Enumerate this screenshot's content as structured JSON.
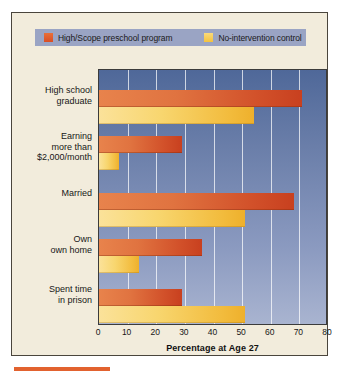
{
  "chart_data": {
    "type": "bar",
    "orientation": "horizontal",
    "title": "",
    "xlabel": "Percentage at Age 27",
    "ylabel": "",
    "xlim": [
      0,
      80
    ],
    "xticks": [
      0,
      10,
      20,
      30,
      40,
      50,
      60,
      70,
      80
    ],
    "grid": true,
    "legend_position": "top",
    "categories": [
      "High school graduate",
      "Earning more than $2,000/month",
      "Married",
      "Own own home",
      "Spent time in prison"
    ],
    "category_label_lines": [
      [
        "High school",
        "graduate"
      ],
      [
        "Earning",
        "more than",
        "$2,000/month"
      ],
      [
        "Married"
      ],
      [
        "Own",
        "own home"
      ],
      [
        "Spent time",
        "in prison"
      ]
    ],
    "series": [
      {
        "name": "High/Scope preschool program",
        "color": "#d2512a",
        "values": [
          71,
          29,
          68,
          36,
          29
        ]
      },
      {
        "name": "No-intervention control",
        "color": "#f2bb3c",
        "values": [
          54,
          7,
          51,
          14,
          51
        ]
      }
    ]
  },
  "legend": {
    "entries": [
      {
        "label": "High/Scope preschool program",
        "swatch": "red-swatch"
      },
      {
        "label": "No-intervention control",
        "swatch": "yellow-swatch"
      }
    ]
  },
  "axis": {
    "title": "Percentage at Age 27",
    "tick_labels": [
      "0",
      "10",
      "20",
      "30",
      "40",
      "50",
      "60",
      "70",
      "80"
    ]
  },
  "colors": {
    "panel_background": "#f2ecdc",
    "plot_background_top": "#4f6899",
    "plot_background_bottom": "#a9b4d0",
    "legend_background": "#9aa4c4",
    "series_red": "#d2512a",
    "series_yellow": "#f2bb3c",
    "accent_rule": "#e2622f",
    "frame_border": "#4a453c"
  }
}
